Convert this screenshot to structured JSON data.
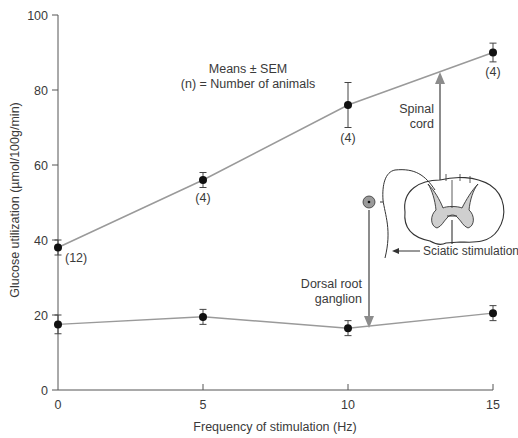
{
  "chart_data": {
    "type": "line",
    "title": "",
    "xlabel": "Frequency of stimulation (Hz)",
    "ylabel": "Glucose utilization (µmol/100g/min)",
    "xlim": [
      0,
      15
    ],
    "ylim": [
      0,
      100
    ],
    "x_ticks": [
      0,
      5,
      10,
      15
    ],
    "y_ticks": [
      0,
      20,
      40,
      60,
      80,
      100
    ],
    "grid": false,
    "x": [
      0,
      5,
      10,
      15
    ],
    "series": [
      {
        "name": "Spinal cord",
        "values": [
          38,
          56,
          76,
          90
        ],
        "sem": [
          2,
          2,
          6,
          2.5
        ],
        "n_labels": [
          "(12)",
          "(4)",
          "(4)",
          "(4)"
        ]
      },
      {
        "name": "Dorsal root ganglion",
        "values": [
          17.5,
          19.5,
          16.5,
          20.5
        ],
        "sem": [
          2.5,
          2,
          2,
          2
        ]
      }
    ],
    "annotations": [
      "Means ± SEM",
      "(n) = Number of animals",
      "Spinal cord",
      "Dorsal root ganglion",
      "Sciatic stimulation"
    ]
  },
  "labels": {
    "legend_line1": "Means ± SEM",
    "legend_line2": "(n) = Number of animals",
    "spinal_cord_1": "Spinal",
    "spinal_cord_2": "cord",
    "drg_1": "Dorsal root",
    "drg_2": "ganglion",
    "sciatic": "Sciatic stimulation",
    "xlabel": "Frequency of stimulation (Hz)",
    "ylabel": "Glucose utilization (µmol/100g/min)"
  },
  "colors": {
    "line": "#9a9a9a",
    "marker": "#111111",
    "axis": "#555555",
    "arrow": "#8c8c8c",
    "gray_matter": "#cfcfcf",
    "ganglion_fill": "#9a9a9a"
  }
}
